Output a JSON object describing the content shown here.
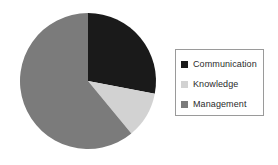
{
  "chart_data": {
    "type": "pie",
    "title": "",
    "categories": [
      "Communication",
      "Knowledge",
      "Management"
    ],
    "values": [
      28,
      11,
      61
    ],
    "unit": "percent",
    "start_angle_deg": 0,
    "direction": "clockwise",
    "colors": [
      "#1a1a1a",
      "#d2d2d2",
      "#7b7b7b"
    ],
    "labels_shown": false,
    "grid": false,
    "legend_position": "right",
    "legend_entries": [
      {
        "label": "Communication",
        "color": "#1a1a1a",
        "value": 28
      },
      {
        "label": "Knowledge",
        "color": "#d2d2d2",
        "value": 11
      },
      {
        "label": "Management",
        "color": "#7b7b7b",
        "value": 61
      }
    ]
  },
  "pie": {
    "center_x": 88,
    "center_y": 81,
    "radius": 68
  },
  "legend": {
    "border_color": "#9a9a9a",
    "background": "#ffffff"
  }
}
